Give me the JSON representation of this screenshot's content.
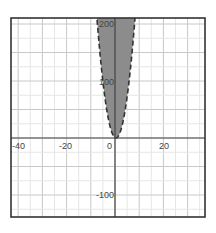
{
  "chart_data": {
    "type": "area",
    "title": "",
    "xlabel": "",
    "ylabel": "",
    "xlim": [
      -43,
      37
    ],
    "ylim": [
      -139,
      210
    ],
    "x_ticks": [
      -40,
      -20,
      0,
      20
    ],
    "y_ticks": [
      100,
      200,
      -100
    ],
    "grid": true,
    "series": [
      {
        "name": "shaded region y > 3.4x^2",
        "kind": "inequality-region",
        "boundary": "y = 3.4x^2",
        "boundary_style": "dashed",
        "fill_color": "#8c8c8c",
        "x": [
          -7.9,
          -5.0,
          -3.0,
          0.0,
          3.0,
          5.8,
          8.7
        ],
        "values": [
          212,
          100,
          31,
          0,
          31,
          100,
          212
        ]
      }
    ]
  },
  "axes": {
    "x_labels": [
      "-40",
      "-20",
      "0",
      "20"
    ],
    "y_labels": [
      "200",
      "100",
      "-100"
    ]
  },
  "colors": {
    "frame": "#333333",
    "axis": "#444444",
    "major_grid": "#c8c8c8",
    "minor_grid": "#e6e6e6",
    "region_fill": "#8c8c8c",
    "boundary": "#333333"
  }
}
